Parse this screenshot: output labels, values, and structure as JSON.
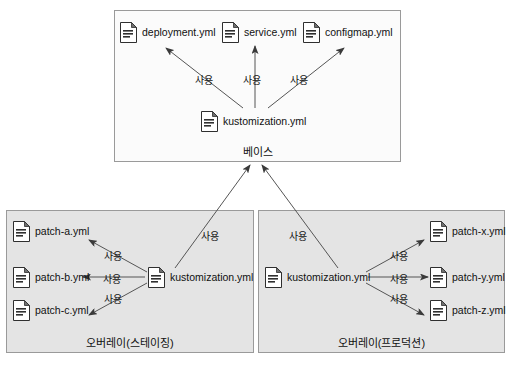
{
  "diagram": {
    "edge_label_default": "사용",
    "colors": {
      "base_fill": "#fbfbfb",
      "overlay_fill": "#e4e4e4",
      "border": "#9a9a9a",
      "arrow": "#3a3a3a",
      "text": "#111111",
      "page_background": "#ffffff"
    }
  },
  "base_group": {
    "label": "베이스",
    "nodes": {
      "deployment": {
        "label": "deployment.yml",
        "icon": "document-icon"
      },
      "service": {
        "label": "service.yml",
        "icon": "document-icon"
      },
      "configmap": {
        "label": "configmap.yml",
        "icon": "document-icon"
      },
      "kustomization": {
        "label": "kustomization.yml",
        "icon": "document-icon"
      }
    },
    "edges": [
      {
        "from": "kustomization",
        "to": "deployment",
        "label": "사용"
      },
      {
        "from": "kustomization",
        "to": "service",
        "label": "사용"
      },
      {
        "from": "kustomization",
        "to": "configmap",
        "label": "사용"
      }
    ]
  },
  "staging_group": {
    "label": "오버레이(스테이징)",
    "nodes": {
      "patch_a": {
        "label": "patch-a.yml",
        "icon": "document-icon"
      },
      "patch_b": {
        "label": "patch-b.yml",
        "icon": "document-icon"
      },
      "patch_c": {
        "label": "patch-c.yml",
        "icon": "document-icon"
      },
      "kustomization": {
        "label": "kustomization.yml",
        "icon": "document-icon"
      }
    },
    "edges": [
      {
        "from": "kustomization",
        "to": "patch_a",
        "label": "사용"
      },
      {
        "from": "kustomization",
        "to": "patch_b",
        "label": "사용"
      },
      {
        "from": "kustomization",
        "to": "patch_c",
        "label": "사용"
      }
    ],
    "edge_to_base": {
      "label": "사용"
    }
  },
  "production_group": {
    "label": "오버레이(프로덕션)",
    "nodes": {
      "patch_x": {
        "label": "patch-x.yml",
        "icon": "document-icon"
      },
      "patch_y": {
        "label": "patch-y.yml",
        "icon": "document-icon"
      },
      "patch_z": {
        "label": "patch-z.yml",
        "icon": "document-icon"
      },
      "kustomization": {
        "label": "kustomization.yml",
        "icon": "document-icon"
      }
    },
    "edges": [
      {
        "from": "kustomization",
        "to": "patch_x",
        "label": "사용"
      },
      {
        "from": "kustomization",
        "to": "patch_y",
        "label": "사용"
      },
      {
        "from": "kustomization",
        "to": "patch_z",
        "label": "사용"
      }
    ],
    "edge_to_base": {
      "label": "사용"
    }
  }
}
